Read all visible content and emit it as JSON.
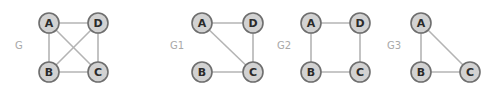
{
  "graphs": [
    {
      "label": "G",
      "label_pos": [
        15,
        45
      ],
      "nodes": [
        {
          "id": "A",
          "x": 49,
          "y": 23
        },
        {
          "id": "D",
          "x": 98,
          "y": 23
        },
        {
          "id": "B",
          "x": 49,
          "y": 72
        },
        {
          "id": "C",
          "x": 98,
          "y": 72
        }
      ],
      "edges": [
        [
          "A",
          "D"
        ],
        [
          "A",
          "B"
        ],
        [
          "A",
          "C"
        ],
        [
          "D",
          "B"
        ],
        [
          "D",
          "C"
        ],
        [
          "B",
          "C"
        ]
      ]
    },
    {
      "label": "G1",
      "label_pos": [
        170,
        45
      ],
      "nodes": [
        {
          "id": "A",
          "x": 202,
          "y": 23
        },
        {
          "id": "D",
          "x": 253,
          "y": 23
        },
        {
          "id": "B",
          "x": 202,
          "y": 72
        },
        {
          "id": "C",
          "x": 253,
          "y": 72
        }
      ],
      "edges": [
        [
          "A",
          "D"
        ],
        [
          "A",
          "C"
        ],
        [
          "D",
          "C"
        ],
        [
          "B",
          "C"
        ]
      ]
    },
    {
      "label": "G2",
      "label_pos": [
        277,
        45
      ],
      "nodes": [
        {
          "id": "A",
          "x": 311,
          "y": 23
        },
        {
          "id": "D",
          "x": 360,
          "y": 23
        },
        {
          "id": "B",
          "x": 311,
          "y": 72
        },
        {
          "id": "C",
          "x": 360,
          "y": 72
        }
      ],
      "edges": [
        [
          "A",
          "D"
        ],
        [
          "A",
          "B"
        ],
        [
          "D",
          "C"
        ],
        [
          "B",
          "C"
        ]
      ]
    },
    {
      "label": "G3",
      "label_pos": [
        387,
        45
      ],
      "nodes": [
        {
          "id": "A",
          "x": 421,
          "y": 23
        },
        {
          "id": "B",
          "x": 421,
          "y": 72
        },
        {
          "id": "C",
          "x": 470,
          "y": 72
        }
      ],
      "edges": [
        [
          "A",
          "B"
        ],
        [
          "A",
          "C"
        ],
        [
          "B",
          "C"
        ]
      ]
    }
  ],
  "style": {
    "node_fill": "#d2d2d2",
    "node_stroke": "#6e6e6e",
    "edge_color": "#b4b4b4",
    "label_color": "#a8a8a8",
    "node_radius": 10
  }
}
